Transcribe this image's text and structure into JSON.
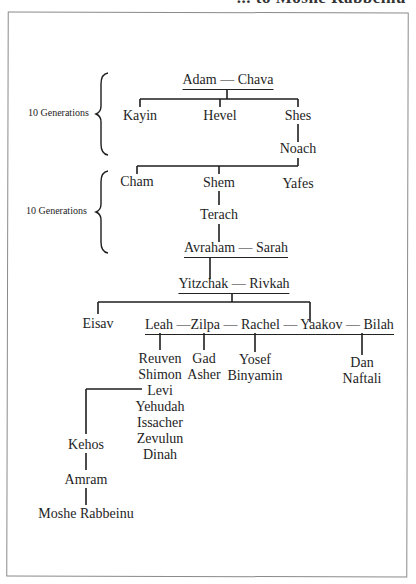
{
  "header": {
    "title_fragment": "... to Moshe Rabbeinu"
  },
  "brackets": {
    "first": {
      "label": "10 Generations"
    },
    "second": {
      "label": "10 Generations"
    }
  },
  "tree": {
    "couples": {
      "adam_chava": "Adam — Chava",
      "avraham_sarah": "Avraham — Sarah",
      "yitzchak_rivkah": "Yitzchak — Rivkah",
      "yaakov_wives": "Leah —Zilpa — Rachel — Yaakov — Bilah"
    },
    "gen_adam": [
      "Kayin",
      "Hevel",
      "Shes"
    ],
    "noach": "Noach",
    "gen_noach": [
      "Cham",
      "Shem",
      "Yafes"
    ],
    "terach": "Terach",
    "eisav": "Eisav",
    "leah_children": [
      "Reuven",
      "Shimon",
      "Levi",
      "Yehudah",
      "Issacher",
      "Zevulun",
      "Dinah"
    ],
    "zilpa_children": [
      "Gad",
      "Asher"
    ],
    "rachel_children": [
      "Yosef",
      "Binyamin"
    ],
    "bilah_children": [
      "Dan",
      "Naftali"
    ],
    "levi_line": [
      "Kehos",
      "Amram",
      "Moshe Rabbeinu"
    ]
  }
}
